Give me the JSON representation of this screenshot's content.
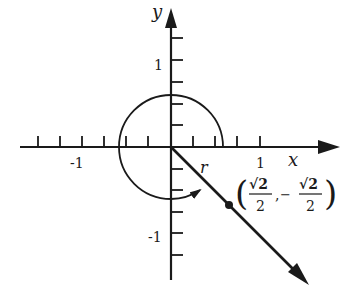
{
  "diagram": {
    "type": "coordinate-plane-angle",
    "axes": {
      "x_label": "x",
      "y_label": "y",
      "x_tick_labels": [
        "-1",
        "1"
      ],
      "y_tick_labels": [
        "1",
        "-1"
      ],
      "tick_spacing": 0.25
    },
    "angle_arc_label": "r",
    "point_label": {
      "open": "(",
      "x_num": "√2",
      "x_den": "2",
      "sep": ",",
      "y_sign": "−",
      "y_num": "√2",
      "y_den": "2",
      "close": ")"
    },
    "colors": {
      "ink": "#1a1a1a",
      "background": "#ffffff"
    }
  }
}
